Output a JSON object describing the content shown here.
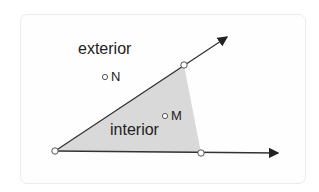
{
  "diagram": {
    "labels": {
      "exterior": "exterior",
      "interior": "interior",
      "point_n": "N",
      "point_m": "M"
    },
    "colors": {
      "shading": "#d9d9d9",
      "lines": "#333333",
      "points": "#ffffff"
    }
  }
}
